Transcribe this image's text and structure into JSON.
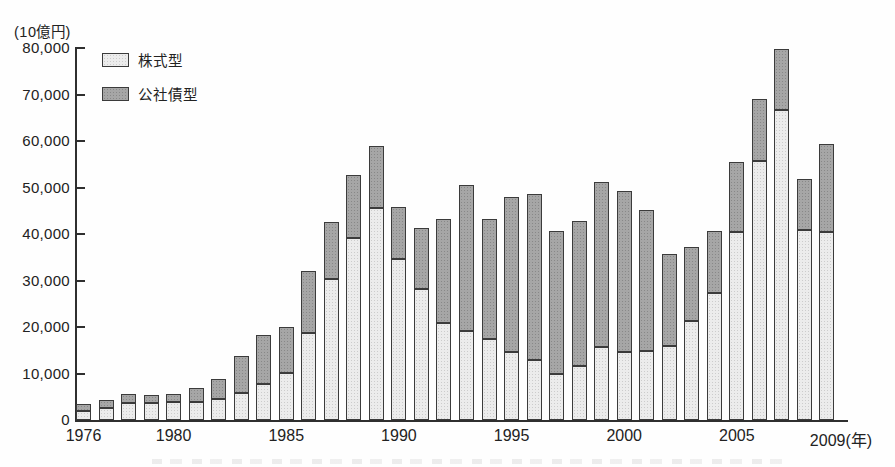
{
  "chart": {
    "unit_label": "(10億円)",
    "x_axis_suffix": "(年)",
    "axis_color": "#2f2f2f",
    "bar_border_color": "#3b3b3b",
    "legend_items": [
      {
        "label": "株式型"
      },
      {
        "label": "公社債型"
      }
    ]
  },
  "chart_data": {
    "type": "bar",
    "stacked": true,
    "title": "",
    "ylabel": "(10億円)",
    "xlabel": "(年)",
    "ylim": [
      0,
      80000
    ],
    "ytick_step": 10000,
    "yticks": [
      0,
      10000,
      20000,
      30000,
      40000,
      50000,
      60000,
      70000,
      80000
    ],
    "grid": false,
    "legend_position": "top-left-inside",
    "categories": [
      1976,
      1977,
      1978,
      1979,
      1980,
      1981,
      1982,
      1983,
      1984,
      1985,
      1986,
      1987,
      1988,
      1989,
      1990,
      1991,
      1992,
      1993,
      1994,
      1995,
      1996,
      1997,
      1998,
      1999,
      2000,
      2001,
      2002,
      2003,
      2004,
      2005,
      2006,
      2007,
      2008,
      2009
    ],
    "xticks_labeled": [
      1976,
      1980,
      1985,
      1990,
      1995,
      2000,
      2005,
      2009
    ],
    "series": [
      {
        "name": "株式型",
        "fill": "#ececec",
        "dot": "#cccccc",
        "values": [
          2000,
          2600,
          3700,
          3600,
          3800,
          3900,
          4600,
          5900,
          7800,
          10100,
          18700,
          30400,
          39200,
          45500,
          34600,
          28200,
          20800,
          19200,
          17500,
          14700,
          12800,
          10000,
          11600,
          15700,
          14700,
          14900,
          15900,
          21200,
          27400,
          40500,
          55600,
          66600,
          40900,
          40500
        ]
      },
      {
        "name": "公社債型",
        "fill": "#a6a6a6",
        "dot": "#888888",
        "values": [
          1500,
          1800,
          1800,
          1700,
          1900,
          3000,
          4300,
          7800,
          10500,
          9900,
          13300,
          12100,
          13500,
          13400,
          11300,
          13100,
          22500,
          31300,
          25700,
          33200,
          35700,
          30600,
          31100,
          35500,
          34600,
          30300,
          19700,
          16000,
          13300,
          15000,
          13400,
          13200,
          10900,
          18800
        ]
      }
    ]
  }
}
